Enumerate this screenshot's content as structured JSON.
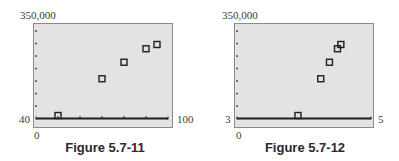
{
  "chart_data": [
    {
      "type": "scatter",
      "title": "Figure 5.7-11",
      "xlabel": "",
      "ylabel": "",
      "xlim": [
        40,
        100
      ],
      "ylim": [
        0,
        350000
      ],
      "x_tick_step": 10,
      "y_tick_step": 50000,
      "grid": false,
      "window_labels": {
        "ymax": "350,000",
        "xmin": "40",
        "xmax": "100",
        "ymin": "0"
      },
      "x": [
        50,
        70,
        80,
        90,
        95
      ],
      "y": [
        12000,
        159000,
        225000,
        279000,
        296000
      ],
      "marker": "open-square"
    },
    {
      "type": "scatter",
      "title": "Figure 5.7-12",
      "xlabel": "",
      "ylabel": "",
      "xlim": [
        3,
        5
      ],
      "ylim": [
        0,
        350000
      ],
      "y_tick_step": 50000,
      "grid": false,
      "window_labels": {
        "ymax": "350,000",
        "xmin": "3",
        "xmax": "5",
        "ymin": "0"
      },
      "x": [
        3.91,
        4.25,
        4.38,
        4.5,
        4.55
      ],
      "y": [
        12000,
        159000,
        225000,
        279000,
        296000
      ],
      "marker": "open-square"
    }
  ],
  "figures": [
    {
      "caption": "Figure 5.7-11",
      "ymax_label": "350,000",
      "xmin_label": "40",
      "xmax_label": "100",
      "ymin_label": "0"
    },
    {
      "caption": "Figure 5.7-12",
      "ymax_label": "350,000",
      "xmin_label": "3",
      "xmax_label": "5",
      "ymin_label": "0"
    }
  ],
  "colors": {
    "plot_bg": "#e3e3e3",
    "axis": "#1e1e1e",
    "marker": "#1e1e1e",
    "frame": "#8a8a8a"
  }
}
